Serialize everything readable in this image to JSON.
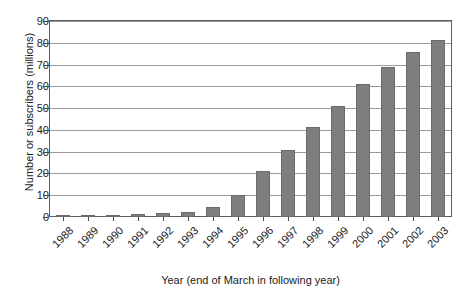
{
  "chart_data": {
    "type": "bar",
    "title": "",
    "xlabel": "Year (end of March in following year)",
    "ylabel": "Number or subscribers (millions)",
    "categories": [
      "1988",
      "1989",
      "1990",
      "1991",
      "1992",
      "1993",
      "1994",
      "1995",
      "1996",
      "1997",
      "1998",
      "1999",
      "2000",
      "2001",
      "2002",
      "2003"
    ],
    "values": [
      0.3,
      0.6,
      1.0,
      1.5,
      1.9,
      2.3,
      4.5,
      10,
      21,
      31,
      41.5,
      51,
      61,
      69,
      76,
      81.5
    ],
    "ylim": [
      0,
      90
    ],
    "yticks": [
      0,
      10,
      20,
      30,
      40,
      50,
      60,
      70,
      80,
      90
    ],
    "ytick_labels": [
      "0",
      "10",
      "20",
      "30",
      "40",
      "50",
      "60",
      "70",
      "80",
      "90"
    ],
    "grid": true,
    "legend": "none",
    "bar_color": "#7e7e7e",
    "series": [
      {
        "name": "Subscribers",
        "values": [
          0.3,
          0.6,
          1.0,
          1.5,
          1.9,
          2.3,
          4.5,
          10,
          21,
          31,
          41.5,
          51,
          61,
          69,
          76,
          81.5
        ]
      }
    ]
  },
  "colors": {
    "bar": "#7e7e7e",
    "bar_border": "#6b6b6b",
    "grid": "#9a9a9a",
    "frame": "#5d5d5d",
    "text": "#1c1c1c",
    "background": "#ffffff"
  }
}
